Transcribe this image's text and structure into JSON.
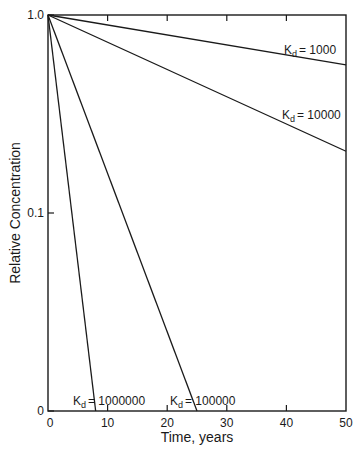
{
  "chart_data": {
    "type": "line",
    "title": "",
    "xlabel": "Time, years",
    "ylabel": "Relative Concentration",
    "xlim": [
      0,
      50
    ],
    "ylim": [
      0.01,
      1.0
    ],
    "yscale": "log",
    "x_ticks": [
      0,
      10,
      20,
      30,
      40,
      50
    ],
    "x_tick_labels": [
      "0",
      "10",
      "20",
      "30",
      "40",
      "50"
    ],
    "y_ticks": [
      1.0,
      0.1,
      0.01
    ],
    "y_tick_labels": [
      "1.0",
      "0.1",
      "0"
    ],
    "grid": false,
    "legend": "inline labels",
    "series": [
      {
        "name": "Kd = 1000",
        "label_k": "K",
        "label_sub": "d",
        "label_val": "=  1000",
        "x": [
          0,
          50
        ],
        "values": [
          1.0,
          0.56
        ]
      },
      {
        "name": "Kd = 10000",
        "label_k": "K",
        "label_sub": "d",
        "label_val": "= 10000",
        "x": [
          0,
          50
        ],
        "values": [
          1.0,
          0.205
        ]
      },
      {
        "name": "Kd = 100000",
        "label_k": "K",
        "label_sub": "d",
        "label_val": "= 100000",
        "x": [
          0,
          25
        ],
        "values": [
          1.0,
          0.01
        ]
      },
      {
        "name": "Kd = 1000000",
        "label_k": "K",
        "label_sub": "d",
        "label_val": "= 1000000",
        "x": [
          0,
          8
        ],
        "values": [
          1.0,
          0.01
        ]
      }
    ]
  },
  "layout": {
    "line_color": "#1a1a1a",
    "background": "#ffffff"
  }
}
